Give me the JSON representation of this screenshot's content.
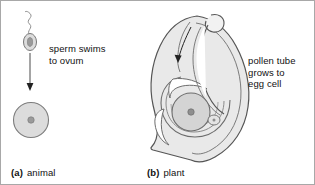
{
  "figure": {
    "background_color": "#ffffff",
    "border_color": "#a8a8a8",
    "width": 315,
    "height": 185
  },
  "colors": {
    "cell_fill": "#d8d8d8",
    "cell_fill_light": "#ececec",
    "tissue_fill": "#e6e6e6",
    "outline": "#555555",
    "outline_light": "#888888",
    "nucleus": "#8a8a8a",
    "arrow": "#222222",
    "text": "#111111"
  },
  "panels": [
    {
      "id": "animal",
      "tag": "(a)",
      "name": "animal",
      "caption": "sperm swims\nto ovum",
      "parts": [
        {
          "name": "sperm-cell",
          "description": "sperm with oval head and wavy flagellum"
        },
        {
          "name": "sperm-nucleus",
          "description": "dark nucleus inside sperm head"
        },
        {
          "name": "migration-arrow",
          "description": "vertical arrow pointing down to the ovum"
        },
        {
          "name": "ovum",
          "description": "round gray egg cell"
        },
        {
          "name": "ovum-nucleus",
          "description": "small dark nucleus at centre of ovum"
        }
      ]
    },
    {
      "id": "plant",
      "tag": "(b)",
      "name": "plant",
      "caption": "pollen tube\ngrows to\negg cell",
      "parts": [
        {
          "name": "ovule-body",
          "description": "teardrop shaped ovule with pointed base"
        },
        {
          "name": "pollen-grain",
          "description": "pollen grain loop at the top of the ovule"
        },
        {
          "name": "pollen-tube",
          "description": "narrow tube running down inside the ovule"
        },
        {
          "name": "pollen-tube-arrow",
          "description": "arrow showing direction of tube growth"
        },
        {
          "name": "embryo-sac",
          "description": "nested curved chamber holding the egg cell"
        },
        {
          "name": "egg-cell",
          "description": "round gray egg cell inside the embryo sac"
        },
        {
          "name": "egg-cell-nucleus",
          "description": "dark nucleus at the centre of the egg cell"
        },
        {
          "name": "synergid-cell",
          "description": "small cell beside the egg cell"
        }
      ]
    }
  ]
}
